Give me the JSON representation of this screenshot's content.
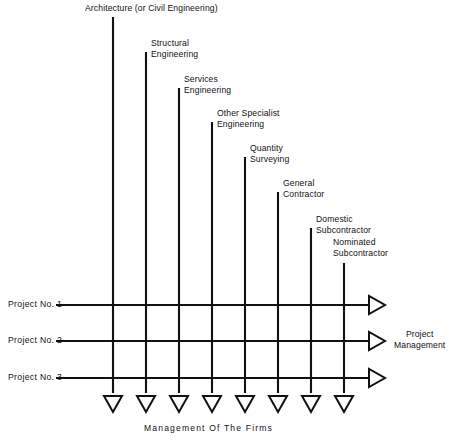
{
  "diagram": {
    "title_footer": "Management Of The Firms",
    "side_label": "Project\nManagement",
    "columns": [
      {
        "label": "Architecture (or Civil Engineering)",
        "x": 113,
        "top": 17
      },
      {
        "label": "Structural\nEngineering",
        "x": 146,
        "top": 52
      },
      {
        "label": "Services\nEngineering",
        "x": 179,
        "top": 88
      },
      {
        "label": "Other Specialist\nEngineering",
        "x": 212,
        "top": 122
      },
      {
        "label": "Quantity\nSurveying",
        "x": 245,
        "top": 157
      },
      {
        "label": "General\nContractor",
        "x": 278,
        "top": 192
      },
      {
        "label": "Domestic\nSubcontractor",
        "x": 311,
        "top": 228
      },
      {
        "label": "Nominated\nSubcontractor",
        "x": 344,
        "top": 263
      }
    ],
    "rows": [
      {
        "label": "Project No. 1",
        "y": 305
      },
      {
        "label": "Project No. 2",
        "y": 341
      },
      {
        "label": "Project No. 3",
        "y": 378
      }
    ],
    "column_labels_pos": [
      {
        "x": 85,
        "y": 3
      },
      {
        "x": 151,
        "y": 38
      },
      {
        "x": 184,
        "y": 74
      },
      {
        "x": 217,
        "y": 108
      },
      {
        "x": 250,
        "y": 143
      },
      {
        "x": 283,
        "y": 178
      },
      {
        "x": 316,
        "y": 214
      },
      {
        "x": 333,
        "y": 237
      }
    ],
    "row_labels_pos": [
      {
        "x": 8,
        "y": 299
      },
      {
        "x": 8,
        "y": 335
      },
      {
        "x": 8,
        "y": 372
      }
    ],
    "footer_pos": {
      "x": 144,
      "y": 423
    },
    "side_label_pos": {
      "x": 394,
      "y": 329
    },
    "geometry": {
      "row_line_start_x": 56,
      "row_arrow_tip_x": 385,
      "col_arrow_tip_y": 412,
      "col_line_bottom_y": 393,
      "arrow_half_width": 9,
      "arrow_length": 16
    },
    "colors": {
      "ink": "#111111",
      "background": "#ffffff"
    }
  }
}
